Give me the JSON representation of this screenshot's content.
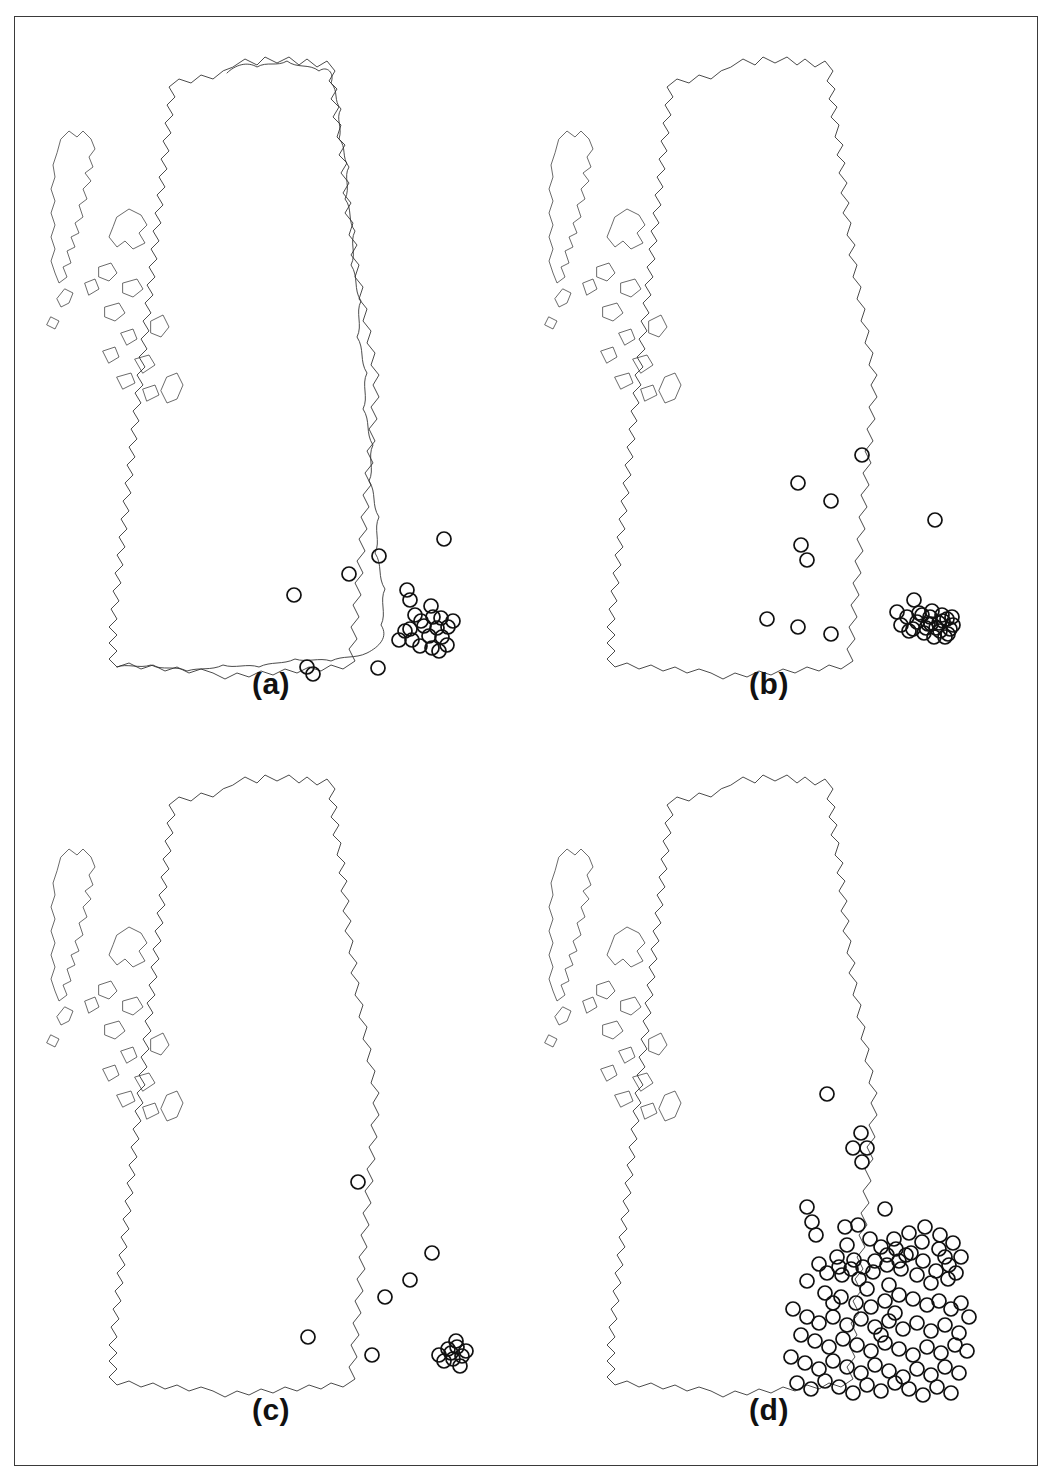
{
  "figure": {
    "type": "multi-panel-distribution-map",
    "region": "Great Britain",
    "panel_count": 4,
    "layout": "2x2",
    "symbol": "open-circle",
    "symbol_diameter_px": 14,
    "frame_color": "#3a3a3a",
    "outline_color": "#2b2b2b",
    "point_color": "#111111",
    "background_color": "#ffffff"
  },
  "panels": [
    {
      "id": "a",
      "label": "(a)",
      "scale_mark": "5",
      "point_count": 28,
      "description": "Sparse distribution, records confined to south-east England, the Thames estuary and London, with outliers in the Midlands and the East Anglian coast"
    },
    {
      "id": "b",
      "label": "(b)",
      "scale_mark": "5",
      "point_count": 36,
      "description": "Moderate distribution extending north into the Midlands and northern England, still concentrated around the Thames estuary and London"
    },
    {
      "id": "c",
      "label": "(c)",
      "scale_mark": "5",
      "point_count": 16,
      "description": "Sparsest distribution, scattered records in eastern and southern England with a small cluster on the Kent coast"
    },
    {
      "id": "d",
      "label": "(d)",
      "scale_mark": "5",
      "point_count": 118,
      "description": "Densest distribution covering most of England south of a line from the Humber to the Mersey, with a very heavy cluster around London and the Thames estuary"
    }
  ],
  "chart_data": {
    "type": "scatter",
    "title": "",
    "xlabel": "",
    "ylabel": "",
    "projection": "Great Britain national grid outline",
    "series": [
      {
        "name": "(a)",
        "values": [
          [
            443,
            522
          ],
          [
            378,
            539
          ],
          [
            348,
            557
          ],
          [
            293,
            578
          ],
          [
            409,
            583
          ],
          [
            406,
            573
          ],
          [
            414,
            598
          ],
          [
            432,
            600
          ],
          [
            440,
            601
          ],
          [
            423,
            609
          ],
          [
            436,
            611
          ],
          [
            447,
            610
          ],
          [
            409,
            612
          ],
          [
            411,
            623
          ],
          [
            428,
            619
          ],
          [
            441,
            620
          ],
          [
            419,
            629
          ],
          [
            431,
            631
          ],
          [
            446,
            628
          ],
          [
            404,
            614
          ],
          [
            398,
            623
          ],
          [
            377,
            651
          ],
          [
            312,
            657
          ],
          [
            306,
            650
          ],
          [
            430,
            589
          ],
          [
            452,
            604
          ],
          [
            438,
            634
          ],
          [
            420,
            604
          ]
        ]
      },
      {
        "name": "(b)",
        "values": [
          [
            861,
            438
          ],
          [
            797,
            466
          ],
          [
            830,
            484
          ],
          [
            934,
            503
          ],
          [
            800,
            528
          ],
          [
            806,
            543
          ],
          [
            766,
            602
          ],
          [
            797,
            610
          ],
          [
            830,
            617
          ],
          [
            913,
            583
          ],
          [
            896,
            595
          ],
          [
            921,
            598
          ],
          [
            931,
            594
          ],
          [
            938,
            606
          ],
          [
            946,
            602
          ],
          [
            927,
            607
          ],
          [
            939,
            614
          ],
          [
            949,
            612
          ],
          [
            916,
            605
          ],
          [
            906,
            600
          ],
          [
            923,
            616
          ],
          [
            933,
            620
          ],
          [
            944,
            620
          ],
          [
            952,
            608
          ],
          [
            912,
            612
          ],
          [
            900,
            608
          ],
          [
            929,
            600
          ],
          [
            941,
            598
          ],
          [
            918,
            596
          ],
          [
            908,
            614
          ],
          [
            935,
            611
          ],
          [
            947,
            617
          ],
          [
            925,
            611
          ],
          [
            951,
            600
          ],
          [
            930,
            607
          ],
          [
            942,
            604
          ]
        ]
      },
      {
        "name": "(c)",
        "values": [
          [
            357,
            1165
          ],
          [
            431,
            1236
          ],
          [
            409,
            1263
          ],
          [
            384,
            1280
          ],
          [
            307,
            1320
          ],
          [
            371,
            1338
          ],
          [
            447,
            1332
          ],
          [
            456,
            1330
          ],
          [
            452,
            1342
          ],
          [
            461,
            1339
          ],
          [
            443,
            1344
          ],
          [
            459,
            1349
          ],
          [
            450,
            1336
          ],
          [
            455,
            1324
          ],
          [
            465,
            1334
          ],
          [
            438,
            1338
          ]
        ]
      },
      {
        "name": "(d)",
        "values": [
          [
            826,
            1077
          ],
          [
            860,
            1116
          ],
          [
            852,
            1131
          ],
          [
            866,
            1131
          ],
          [
            861,
            1145
          ],
          [
            806,
            1190
          ],
          [
            884,
            1192
          ],
          [
            811,
            1205
          ],
          [
            815,
            1218
          ],
          [
            844,
            1210
          ],
          [
            857,
            1208
          ],
          [
            869,
            1222
          ],
          [
            846,
            1228
          ],
          [
            853,
            1243
          ],
          [
            836,
            1240
          ],
          [
            818,
            1247
          ],
          [
            895,
            1232
          ],
          [
            905,
            1238
          ],
          [
            921,
            1225
          ],
          [
            938,
            1232
          ],
          [
            944,
            1240
          ],
          [
            886,
            1248
          ],
          [
            900,
            1252
          ],
          [
            872,
            1255
          ],
          [
            841,
            1258
          ],
          [
            858,
            1262
          ],
          [
            866,
            1272
          ],
          [
            888,
            1268
          ],
          [
            916,
            1258
          ],
          [
            930,
            1266
          ],
          [
            947,
            1262
          ],
          [
            955,
            1256
          ],
          [
            806,
            1264
          ],
          [
            824,
            1276
          ],
          [
            832,
            1286
          ],
          [
            840,
            1280
          ],
          [
            855,
            1286
          ],
          [
            870,
            1290
          ],
          [
            884,
            1284
          ],
          [
            898,
            1278
          ],
          [
            912,
            1282
          ],
          [
            926,
            1288
          ],
          [
            938,
            1284
          ],
          [
            950,
            1292
          ],
          [
            960,
            1286
          ],
          [
            792,
            1292
          ],
          [
            806,
            1300
          ],
          [
            818,
            1306
          ],
          [
            832,
            1300
          ],
          [
            846,
            1308
          ],
          [
            860,
            1302
          ],
          [
            874,
            1310
          ],
          [
            888,
            1304
          ],
          [
            902,
            1312
          ],
          [
            916,
            1306
          ],
          [
            930,
            1314
          ],
          [
            944,
            1308
          ],
          [
            958,
            1316
          ],
          [
            968,
            1300
          ],
          [
            800,
            1318
          ],
          [
            814,
            1324
          ],
          [
            828,
            1330
          ],
          [
            842,
            1322
          ],
          [
            856,
            1328
          ],
          [
            870,
            1334
          ],
          [
            884,
            1326
          ],
          [
            898,
            1332
          ],
          [
            912,
            1338
          ],
          [
            926,
            1330
          ],
          [
            940,
            1336
          ],
          [
            954,
            1328
          ],
          [
            966,
            1334
          ],
          [
            790,
            1340
          ],
          [
            804,
            1346
          ],
          [
            818,
            1352
          ],
          [
            832,
            1344
          ],
          [
            846,
            1350
          ],
          [
            860,
            1356
          ],
          [
            874,
            1348
          ],
          [
            888,
            1354
          ],
          [
            902,
            1360
          ],
          [
            916,
            1352
          ],
          [
            930,
            1358
          ],
          [
            944,
            1350
          ],
          [
            958,
            1356
          ],
          [
            796,
            1366
          ],
          [
            810,
            1372
          ],
          [
            824,
            1364
          ],
          [
            838,
            1370
          ],
          [
            852,
            1376
          ],
          [
            866,
            1368
          ],
          [
            880,
            1374
          ],
          [
            894,
            1366
          ],
          [
            908,
            1372
          ],
          [
            922,
            1378
          ],
          [
            936,
            1370
          ],
          [
            950,
            1376
          ],
          [
            880,
            1230
          ],
          [
            893,
            1222
          ],
          [
            908,
            1216
          ],
          [
            924,
            1210
          ],
          [
            939,
            1218
          ],
          [
            952,
            1226
          ],
          [
            960,
            1240
          ],
          [
            948,
            1248
          ],
          [
            935,
            1254
          ],
          [
            922,
            1244
          ],
          [
            910,
            1236
          ],
          [
            898,
            1244
          ],
          [
            886,
            1238
          ],
          [
            874,
            1244
          ],
          [
            862,
            1250
          ],
          [
            850,
            1252
          ],
          [
            838,
            1250
          ],
          [
            826,
            1256
          ],
          [
            880,
            1318
          ],
          [
            894,
            1296
          ]
        ]
      }
    ],
    "grid": false,
    "legend_position": "none"
  }
}
